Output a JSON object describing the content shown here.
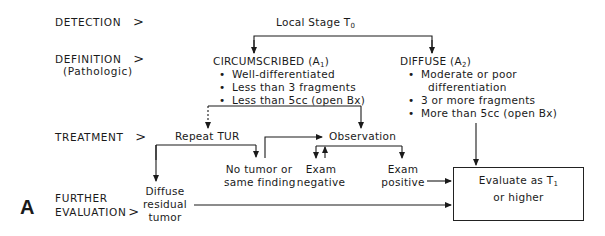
{
  "rows": {
    "detection": {
      "label": "DETECTION",
      "arrow": ">"
    },
    "definition": {
      "label": "DEFINITION",
      "sublabel": "(Pathologic)",
      "arrow": ">"
    },
    "treatment": {
      "label": "TREATMENT",
      "arrow": ">"
    },
    "further": {
      "label_line1": "FURTHER",
      "label_line2": "EVALUATION",
      "arrow": ">"
    }
  },
  "nodes": {
    "stage": {
      "text": "Local Stage T",
      "sub": "0"
    },
    "circumscribed": {
      "title": "CIRCUMSCRIBED (A",
      "sub": "1",
      "close": ")",
      "bullets": [
        "Well-differentiated",
        "Less than 3 fragments",
        "Less than 5cc (open Bx)"
      ]
    },
    "diffuse": {
      "title": "DIFFUSE (A",
      "sub": "2",
      "close": ")",
      "bullets": [
        "Moderate or poor",
        "differentiation",
        "3 or more fragments",
        "More than 5cc (open Bx)"
      ]
    },
    "repeat_tur": "Repeat TUR",
    "observation": "Observation",
    "no_tumor": {
      "line1": "No tumor or",
      "line2": "same finding"
    },
    "exam_negative": {
      "line1": "Exam",
      "line2": "negative"
    },
    "exam_positive": {
      "line1": "Exam",
      "line2": "positive"
    },
    "diffuse_residual": {
      "line1": "Diffuse",
      "line2": "residual",
      "line3": "tumor"
    },
    "evaluate": {
      "line1": "Evaluate as T",
      "sub": "1",
      "line2": "or higher"
    }
  },
  "panel_label": "A"
}
